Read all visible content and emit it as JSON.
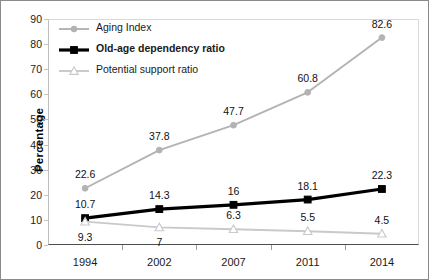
{
  "chart_data": {
    "type": "line",
    "title": "",
    "xlabel": "",
    "ylabel": "Percentage",
    "categories": [
      "1994",
      "2002",
      "2007",
      "2011",
      "2014"
    ],
    "ylim": [
      0,
      90
    ],
    "yticks": [
      "0",
      "10",
      "20",
      "30",
      "40",
      "50",
      "60",
      "70",
      "80",
      "90"
    ],
    "grid": false,
    "legend_position": "top-left-inside",
    "series": [
      {
        "name": "Aging Index",
        "color": "#b3b3b3",
        "marker": "circle",
        "marker_fill": "#b3b3b3",
        "bold": false,
        "values": [
          22.6,
          37.8,
          47.7,
          60.8,
          82.6
        ],
        "labels": [
          "22.6",
          "37.8",
          "47.7",
          "60.8",
          "82.6"
        ],
        "label_side": [
          "above",
          "above",
          "above",
          "above",
          "above"
        ]
      },
      {
        "name": "Old-age dependency ratio",
        "color": "#000000",
        "marker": "square",
        "marker_fill": "#000000",
        "bold": true,
        "values": [
          10.7,
          14.3,
          16,
          18.1,
          22.3
        ],
        "labels": [
          "10.7",
          "14.3",
          "16",
          "18.1",
          "22.3"
        ],
        "label_side": [
          "above",
          "above",
          "above",
          "above",
          "above"
        ]
      },
      {
        "name": "Potential support ratio",
        "color": "#c9c9c9",
        "marker": "triangle",
        "marker_fill": "#ffffff",
        "bold": false,
        "values": [
          9.3,
          7,
          6.3,
          5.5,
          4.5
        ],
        "labels": [
          "9.3",
          "7",
          "6.3",
          "5.5",
          "4.5"
        ],
        "label_side": [
          "below",
          "below",
          "above",
          "above",
          "above"
        ]
      }
    ]
  }
}
